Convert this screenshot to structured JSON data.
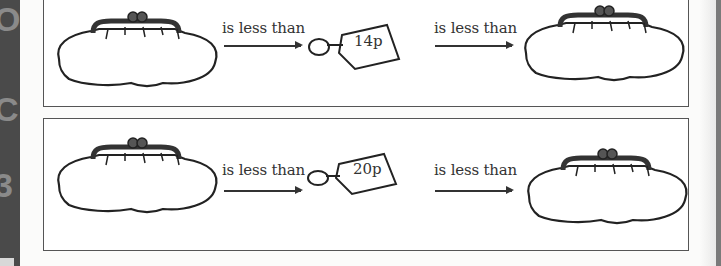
{
  "side_glyphs": [
    "O",
    "C",
    "3"
  ],
  "panels": [
    {
      "items": [
        {
          "type": "purse",
          "label": ""
        },
        {
          "type": "relation",
          "label": "is less than"
        },
        {
          "type": "price-tag",
          "label": "14p"
        },
        {
          "type": "relation",
          "label": "is less than"
        },
        {
          "type": "purse",
          "label": ""
        }
      ]
    },
    {
      "items": [
        {
          "type": "purse",
          "label": ""
        },
        {
          "type": "relation",
          "label": "is less than"
        },
        {
          "type": "price-tag",
          "label": "20p"
        },
        {
          "type": "relation",
          "label": "is less than"
        },
        {
          "type": "purse",
          "label": ""
        }
      ]
    }
  ],
  "colors": {
    "line": "#333333",
    "panel_border": "#555555",
    "strip": "#4a4a4a"
  }
}
